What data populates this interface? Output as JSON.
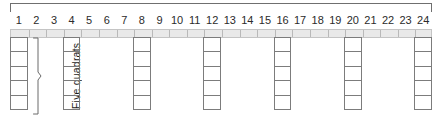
{
  "figure": {
    "span_bracket_name": "transect-span-bracket",
    "label_five_quadrats": "Five quadrats"
  },
  "scale": {
    "unit_count": 24,
    "tick_labels": [
      "1",
      "2",
      "3",
      "4",
      "5",
      "6",
      "7",
      "8",
      "9",
      "10",
      "11",
      "12",
      "13",
      "14",
      "15",
      "16",
      "17",
      "18",
      "19",
      "20",
      "21",
      "22",
      "23",
      "24"
    ],
    "strip_color": "#e9e9e9",
    "tick_color": "#b9b9b9"
  },
  "quadrats": {
    "cells_per_column": 5,
    "box_border_color": "#7c7c7c",
    "columns": [
      {
        "position": 1,
        "label": "1"
      },
      {
        "position": 4,
        "label": "4"
      },
      {
        "position": 8,
        "label": "8"
      },
      {
        "position": 12,
        "label": "12"
      },
      {
        "position": 16,
        "label": "16"
      },
      {
        "position": 20,
        "label": "20"
      },
      {
        "position": 24,
        "label": "24"
      }
    ]
  },
  "chart_data": {
    "type": "diagram",
    "title": "",
    "xlabel": "",
    "ylabel": "",
    "x_axis": {
      "ticks": [
        1,
        2,
        3,
        4,
        5,
        6,
        7,
        8,
        9,
        10,
        11,
        12,
        13,
        14,
        15,
        16,
        17,
        18,
        19,
        20,
        21,
        22,
        23,
        24
      ],
      "range": [
        1,
        24
      ]
    },
    "sampling_positions": [
      1,
      4,
      8,
      12,
      16,
      20,
      24
    ],
    "stack_height": 5,
    "annotations": [
      "Five quadrats"
    ]
  }
}
